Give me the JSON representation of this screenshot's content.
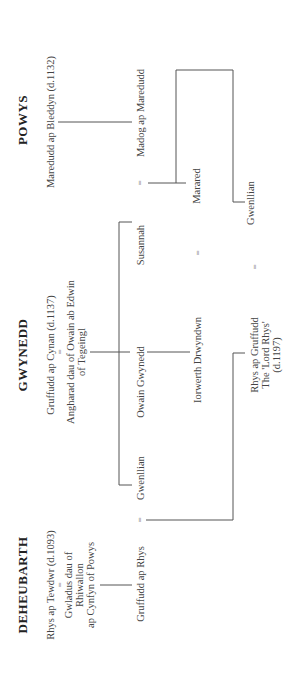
{
  "headers": {
    "powys": "POWYS",
    "gwynedd": "GWYNEDD",
    "deheubarth": "DEHEUBARTH"
  },
  "persons": {
    "maredudd": "Maredudd ap Bleddyn (d.1132)",
    "madog": "Madog ap Maredudd",
    "marared": "Marared",
    "gwenllian_powys": "Gwenllian",
    "susannah": "Susannah",
    "gruffudd_cynan": "Gruffudd ap  Cynan (d.1137)",
    "angharad": "Angharad dau of Owain ab Edwin\nof Tegeingl",
    "owain": "Owain Gwynedd",
    "iorwerth": "Iorwerth Drwyndwn",
    "rhys_gruffudd": "Rhys ap Gruffudd\nThe 'Lord Rhys'\n(d.1197)",
    "gwenllian_gwynedd": "Gwenllian",
    "rhys_tewdwr": "Rhys ap Tewdwr (d.1093)",
    "gwladus": "Gwladus dau of\nRhiwallon\nap Cynfyn of Powys",
    "gruffudd_rhys": "Gruffudd ap Rhys"
  },
  "marriage_symbol": "="
}
